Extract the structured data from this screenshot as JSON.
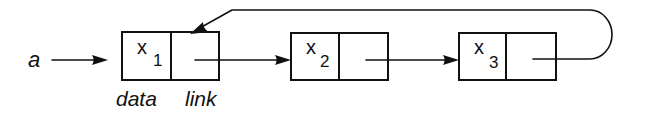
{
  "diagram": {
    "pointer_label": "a",
    "field_labels": {
      "data": "data",
      "link": "link"
    },
    "nodes": [
      {
        "var": "x",
        "sub": "1"
      },
      {
        "var": "x",
        "sub": "2"
      },
      {
        "var": "x",
        "sub": "3"
      }
    ],
    "colors": {
      "ink": "#111111",
      "background": "#ffffff"
    }
  }
}
